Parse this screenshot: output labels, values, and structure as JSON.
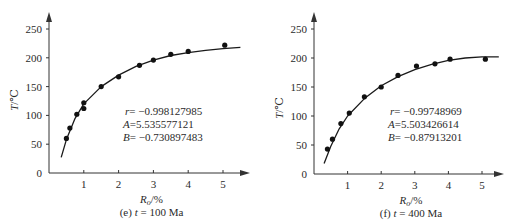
{
  "chart_data": [
    {
      "type": "scatter",
      "panel_id": "e",
      "caption": "(e) t = 100 Ma",
      "caption_prefix": "(e) ",
      "caption_var": "t",
      "caption_suffix": " = 100 Ma",
      "xlabel": "Ro/%",
      "xlabel_main": "R",
      "xlabel_sub": "o",
      "xlabel_unit": "/%",
      "ylabel": "T/℃",
      "ylabel_var": "T",
      "ylabel_unit": "/℃",
      "xlim": [
        0,
        5.5
      ],
      "ylim": [
        0,
        270
      ],
      "xticks": [
        "1",
        "2",
        "3",
        "4",
        "5"
      ],
      "yticks": [
        "0",
        "50",
        "100",
        "150",
        "200",
        "250"
      ],
      "grid": false,
      "series": [
        {
          "name": "measured",
          "x": [
            0.5,
            0.6,
            0.8,
            1.0,
            1.0,
            1.5,
            2.0,
            2.6,
            3.0,
            3.5,
            4.0,
            5.05
          ],
          "y": [
            60,
            78,
            102,
            112,
            122,
            150,
            167,
            187,
            196,
            206,
            211,
            222
          ]
        },
        {
          "name": "fit",
          "type": "line",
          "x": [
            0.35,
            0.5,
            0.75,
            1.0,
            1.5,
            2.0,
            2.5,
            3.0,
            3.5,
            4.0,
            4.5,
            5.0,
            5.5
          ],
          "y": [
            27,
            58,
            95,
            120,
            150,
            170,
            185,
            196,
            204,
            209,
            213,
            216,
            218
          ]
        }
      ],
      "annotations": {
        "r_label": "r",
        "r_value": "= −0.998127985",
        "A_label": "A",
        "A_value": "=5.535577121",
        "B_label": "B",
        "B_value": "= −0.730897483"
      }
    },
    {
      "type": "scatter",
      "panel_id": "f",
      "caption": "(f) t = 400 Ma",
      "caption_prefix": "(f) ",
      "caption_var": "t",
      "caption_suffix": " = 400 Ma",
      "xlabel": "Ro/%",
      "xlabel_main": "R",
      "xlabel_sub": "o",
      "xlabel_unit": "/%",
      "ylabel": "T/℃",
      "ylabel_var": "T",
      "ylabel_unit": "/℃",
      "xlim": [
        0,
        5.5
      ],
      "ylim": [
        0,
        270
      ],
      "xticks": [
        "1",
        "2",
        "3",
        "4",
        "5"
      ],
      "yticks": [
        "0",
        "50",
        "100",
        "150",
        "200",
        "250"
      ],
      "grid": false,
      "series": [
        {
          "name": "measured",
          "x": [
            0.4,
            0.55,
            0.8,
            1.05,
            1.5,
            2.0,
            2.5,
            3.05,
            3.6,
            4.05,
            5.1
          ],
          "y": [
            43,
            60,
            87,
            105,
            133,
            150,
            170,
            186,
            190,
            198,
            198
          ]
        },
        {
          "name": "fit",
          "type": "line",
          "x": [
            0.3,
            0.5,
            0.75,
            1.0,
            1.5,
            2.0,
            2.5,
            3.0,
            3.5,
            4.0,
            4.5,
            5.0,
            5.5
          ],
          "y": [
            18,
            48,
            78,
            100,
            130,
            152,
            168,
            180,
            189,
            196,
            200,
            202,
            202
          ]
        }
      ],
      "annotations": {
        "r_label": "r",
        "r_value": "= −0.99748969",
        "A_label": "A",
        "A_value": "=5.503426614",
        "B_label": "B",
        "B_value": "= −0.87913201"
      }
    }
  ],
  "style": {
    "axis_color": "#333333",
    "curve_color": "#1a1a1a",
    "point_color": "#111111",
    "text_color": "#2a2a2a"
  }
}
